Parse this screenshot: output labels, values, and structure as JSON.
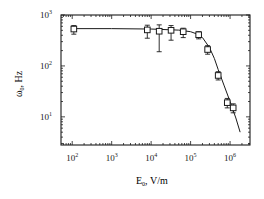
{
  "chart_data": {
    "type": "scatter",
    "title": "",
    "xlabel": "E0, V/m",
    "ylabel": "ω0, Hz",
    "xscale": "log",
    "yscale": "log",
    "xlim": [
      52,
      3200000
    ],
    "ylim": [
      2.8,
      1000
    ],
    "grid": false,
    "legend": null,
    "xticks": [
      {
        "value": 100,
        "base": "10",
        "exp": "2"
      },
      {
        "value": 1000,
        "base": "10",
        "exp": "3"
      },
      {
        "value": 10000,
        "base": "10",
        "exp": "4"
      },
      {
        "value": 100000,
        "base": "10",
        "exp": "5"
      },
      {
        "value": 1000000,
        "base": "10",
        "exp": "6"
      }
    ],
    "yticks": [
      {
        "value": 10,
        "base": "10",
        "exp": "1"
      },
      {
        "value": 100,
        "base": "10",
        "exp": "2"
      },
      {
        "value": 1000,
        "base": "10",
        "exp": "3"
      }
    ],
    "series": [
      {
        "name": "measured",
        "marker": "open-square",
        "points": [
          {
            "x": 110,
            "y": 530,
            "err_lo": 110,
            "err_hi": 90
          },
          {
            "x": 8000,
            "y": 510,
            "err_lo": 160,
            "err_hi": 120
          },
          {
            "x": 16000,
            "y": 480,
            "err_lo": 290,
            "err_hi": 160
          },
          {
            "x": 32000,
            "y": 500,
            "err_lo": 180,
            "err_hi": 120
          },
          {
            "x": 65000,
            "y": 470,
            "err_lo": 110,
            "err_hi": 80
          },
          {
            "x": 160000,
            "y": 410,
            "err_lo": 70,
            "err_hi": 60
          },
          {
            "x": 270000,
            "y": 210,
            "err_lo": 40,
            "err_hi": 40
          },
          {
            "x": 500000,
            "y": 65,
            "err_lo": 12,
            "err_hi": 12
          },
          {
            "x": 850000,
            "y": 19,
            "err_lo": 4,
            "err_hi": 4
          },
          {
            "x": 1200000,
            "y": 15,
            "err_lo": 3,
            "err_hi": 3
          }
        ]
      },
      {
        "name": "fit",
        "type": "line",
        "x": [
          110,
          1000,
          10000,
          50000,
          100000,
          150000,
          200000,
          300000,
          400000,
          500000,
          700000,
          1000000,
          1400000,
          1800000
        ],
        "values": [
          540,
          540,
          530,
          505,
          470,
          420,
          360,
          230,
          140,
          85,
          42,
          20,
          9.5,
          5
        ]
      }
    ]
  },
  "labels": {
    "y_axis_main": "ω",
    "y_axis_sub": "0",
    "y_axis_unit": ", Hz",
    "x_axis_main": "E",
    "x_axis_sub": "0",
    "x_axis_unit": ", V/m"
  }
}
